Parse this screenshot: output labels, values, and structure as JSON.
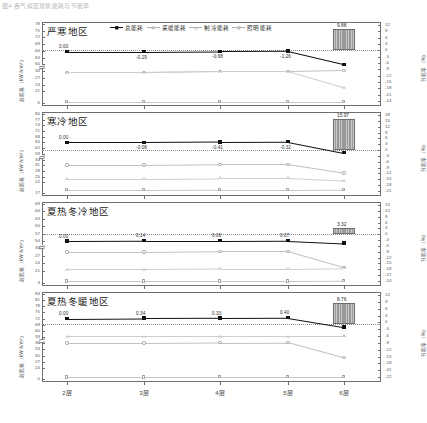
{
  "figure": {
    "caption": "图4  各气候区建筑能耗与节能率",
    "xlabel_ticks": [
      "2层",
      "3层",
      "4层",
      "5层",
      "6层"
    ],
    "left_axis_title": "总能耗（kW·h/m²）",
    "right_axis_title": "节能率（%）",
    "legend": [
      {
        "label": "总能耗",
        "marker": "filled-square",
        "style": "solid"
      },
      {
        "label": "采暖能耗",
        "marker": "open-circle",
        "style": "pale"
      },
      {
        "label": "制冷能耗",
        "marker": "open-triangle",
        "style": "pale"
      },
      {
        "label": "照明能耗",
        "marker": "open-square",
        "style": "pale"
      }
    ]
  },
  "chart_data": [
    {
      "type": "line",
      "title": "严寒地区",
      "categories": [
        "2层",
        "3层",
        "4层",
        "5层",
        "6层"
      ],
      "xlabel": "",
      "ylabel": "总能耗（kW·h/m²）",
      "y2label": "节能率（%）",
      "ylim": [
        6,
        78
      ],
      "yticks": [
        78,
        75,
        72,
        69,
        66,
        63,
        60,
        30,
        27,
        24,
        21,
        6
      ],
      "y_axis_break": true,
      "y2lim": [
        -24,
        12
      ],
      "y2ticks": [
        12,
        9,
        6,
        3,
        0,
        -3,
        -6,
        -9,
        -12,
        -15,
        -18,
        -21,
        -24
      ],
      "grid": false,
      "legend_position": "top-center",
      "series": [
        {
          "name": "总能耗",
          "marker": "filled-square",
          "values": [
            65.6,
            65.6,
            65.8,
            65.9,
            60.0
          ]
        },
        {
          "name": "采暖能耗",
          "marker": "open-circle",
          "values": [
            29.4,
            29.4,
            29.9,
            29.9,
            33.0
          ]
        },
        {
          "name": "制冷能耗",
          "marker": "open-triangle",
          "values": [
            29.4,
            29.4,
            29.9,
            29.9,
            22.6
          ]
        },
        {
          "name": "照明能耗",
          "marker": "open-square",
          "values": [
            7.3,
            7.3,
            7.3,
            7.3,
            7.3
          ]
        }
      ],
      "data_labels": [
        "0.00",
        "-0.29",
        "-0.68",
        "-1.26",
        ""
      ],
      "bar": {
        "category": "6层",
        "value": 9.88,
        "label": "9.88"
      }
    },
    {
      "type": "line",
      "title": "寒冷地区",
      "categories": [
        "2层",
        "3层",
        "4层",
        "5层",
        "6层"
      ],
      "xlabel": "",
      "ylabel": "总能耗（kW·h/m²）",
      "y2label": "节能率（%）",
      "ylim": [
        17,
        80
      ],
      "yticks": [
        80,
        77,
        74,
        71,
        68,
        65,
        62,
        59,
        34,
        31,
        28,
        25,
        22,
        17
      ],
      "y_axis_break": true,
      "y2lim": [
        -21,
        18
      ],
      "y2ticks": [
        18,
        15,
        12,
        9,
        6,
        3,
        0,
        -3,
        -6,
        -9,
        -12,
        -15,
        -18,
        -21
      ],
      "grid": false,
      "legend_position": "none",
      "series": [
        {
          "name": "总能耗",
          "marker": "filled-square",
          "values": [
            65.0,
            65.0,
            65.2,
            65.3,
            59.5
          ]
        },
        {
          "name": "采暖能耗",
          "marker": "open-circle",
          "values": [
            31.0,
            31.0,
            31.4,
            31.4,
            26.8
          ]
        },
        {
          "name": "制冷能耗",
          "marker": "open-triangle",
          "values": [
            24.0,
            24.0,
            24.3,
            24.3,
            23.0
          ]
        },
        {
          "name": "照明能耗",
          "marker": "open-square",
          "values": [
            18.5,
            18.5,
            18.6,
            18.6,
            18.7
          ]
        }
      ],
      "data_labels": [
        "0.00",
        "-0.08",
        "-0.41",
        "-0.32",
        ""
      ],
      "bar": {
        "category": "6层",
        "value": 15.97,
        "label": "15.97"
      }
    },
    {
      "type": "line",
      "title": "夏热冬冷地区",
      "categories": [
        "2层",
        "3层",
        "4层",
        "5层",
        "6层"
      ],
      "xlabel": "",
      "ylabel": "总能耗（kW·h/m²）",
      "y2label": "节能率（%）",
      "ylim": [
        3,
        69
      ],
      "yticks": [
        69,
        66,
        63,
        60,
        57,
        54,
        30,
        27,
        24,
        21,
        3
      ],
      "y_axis_break": true,
      "y2lim": [
        -24,
        15
      ],
      "y2ticks": [
        15,
        12,
        9,
        6,
        3,
        0,
        -3,
        -6,
        -9,
        -12,
        -15,
        -18,
        -21,
        -24
      ],
      "grid": false,
      "legend_position": "none",
      "series": [
        {
          "name": "总能耗",
          "marker": "filled-square",
          "values": [
            54.0,
            54.1,
            54.1,
            54.2,
            47.8
          ]
        },
        {
          "name": "采暖能耗",
          "marker": "open-circle",
          "values": [
            28.5,
            28.5,
            28.8,
            28.8,
            22.3
          ]
        },
        {
          "name": "制冷能耗",
          "marker": "open-triangle",
          "values": [
            21.5,
            21.5,
            21.7,
            21.7,
            22.0
          ]
        },
        {
          "name": "照明能耗",
          "marker": "open-square",
          "values": [
            5.5,
            5.5,
            5.6,
            5.6,
            5.8
          ]
        }
      ],
      "data_labels": [
        "0.00",
        "0.14",
        "0.06",
        "0.07",
        ""
      ],
      "bar": {
        "category": "6层",
        "value": 3.32,
        "label": "3.32"
      }
    },
    {
      "type": "line",
      "title": "夏热冬暖地区",
      "categories": [
        "2层",
        "3层",
        "4层",
        "5层",
        "6层"
      ],
      "xlabel": "",
      "ylabel": "总能耗（kW·h/m²）",
      "y2label": "节能率（%）",
      "ylim": [
        0,
        84
      ],
      "yticks": [
        84,
        81,
        78,
        75,
        72,
        69,
        60,
        39,
        36,
        33,
        30,
        27,
        24,
        0
      ],
      "y_axis_break": true,
      "y2lim": [
        -22,
        12
      ],
      "y2ticks": [
        12,
        9,
        6,
        3,
        0,
        -3,
        -6,
        -9,
        -12,
        -15,
        -18,
        -21,
        -22
      ],
      "grid": false,
      "legend_position": "none",
      "series": [
        {
          "name": "总能耗",
          "marker": "filled-square",
          "values": [
            72.0,
            72.2,
            72.3,
            72.4,
            65.8
          ]
        },
        {
          "name": "采暖能耗",
          "marker": "open-circle",
          "values": [
            36.0,
            36.0,
            36.3,
            36.4,
            29.0
          ]
        },
        {
          "name": "制冷能耗",
          "marker": "open-triangle",
          "values": [
            41.5,
            41.5,
            41.6,
            41.6,
            41.7
          ]
        },
        {
          "name": "照明能耗",
          "marker": "open-square",
          "values": [
            4.0,
            4.0,
            4.2,
            4.2,
            4.4
          ]
        }
      ],
      "data_labels": [
        "0.00",
        "0.34",
        "0.33",
        "0.40",
        ""
      ],
      "bar": {
        "category": "6层",
        "value": 8.76,
        "label": "8.76"
      }
    }
  ]
}
